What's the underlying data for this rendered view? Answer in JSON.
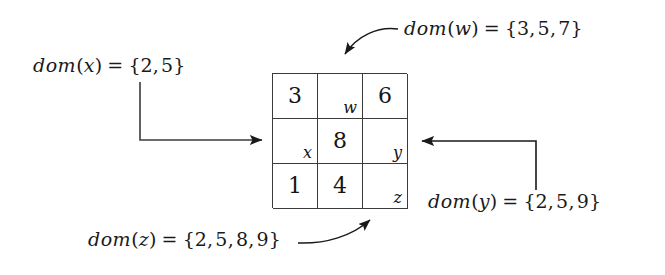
{
  "figure": {
    "background_color": "#ffffff",
    "line_color": "#3b3b3b",
    "text_color": "#151515"
  },
  "grid": {
    "rows": 3,
    "cols": 3,
    "cells": [
      {
        "value": "3",
        "varname": ""
      },
      {
        "value": "",
        "varname": "w"
      },
      {
        "value": "6",
        "varname": ""
      },
      {
        "value": "",
        "varname": "x"
      },
      {
        "value": "8",
        "varname": ""
      },
      {
        "value": "",
        "varname": "y"
      },
      {
        "value": "1",
        "varname": ""
      },
      {
        "value": "4",
        "varname": ""
      },
      {
        "value": "",
        "varname": "z"
      }
    ]
  },
  "annotations": {
    "dom_x": {
      "fn": "dom",
      "open": "(",
      "var": "x",
      "close": ")",
      "eq": "=",
      "brace_open": "{",
      "values": [
        "2",
        "5"
      ],
      "brace_close": "}",
      "full_text": "dom(x) = {2, 5}"
    },
    "dom_w": {
      "fn": "dom",
      "open": "(",
      "var": "w",
      "close": ")",
      "eq": "=",
      "brace_open": "{",
      "values": [
        "3",
        "5",
        "7"
      ],
      "brace_close": "}",
      "full_text": "dom(w) = {3, 5, 7}"
    },
    "dom_y": {
      "fn": "dom",
      "open": "(",
      "var": "y",
      "close": ")",
      "eq": "=",
      "brace_open": "{",
      "values": [
        "2",
        "5",
        "9"
      ],
      "brace_close": "}",
      "full_text": "dom(y) = {2, 5, 9}"
    },
    "dom_z": {
      "fn": "dom",
      "open": "(",
      "var": "z",
      "close": ")",
      "eq": "=",
      "brace_open": "{",
      "values": [
        "2",
        "5",
        "8",
        "9"
      ],
      "brace_close": "}",
      "full_text": "dom(z) = {2, 5, 8, 9}"
    }
  }
}
